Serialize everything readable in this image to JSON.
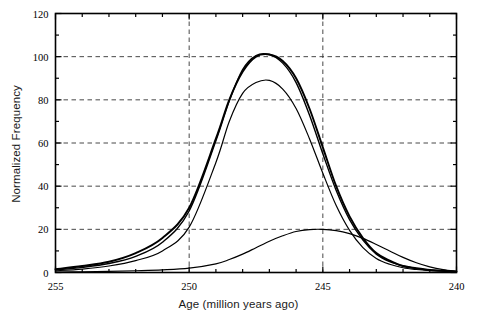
{
  "chart_data": {
    "type": "line",
    "title": "",
    "xlabel": "Age (million years ago)",
    "ylabel": "Normalized Frequency",
    "xlim": [
      255,
      240
    ],
    "ylim": [
      0,
      120
    ],
    "x_reversed": true,
    "grid": true,
    "grid_style": "dashed",
    "legend_position": "none",
    "xticks_major": [
      255,
      250,
      245,
      240
    ],
    "xticks_major_labels": [
      "255",
      "250",
      "245",
      "240"
    ],
    "xtick_minor_interval": 1,
    "yticks_major": [
      0,
      20,
      40,
      60,
      80,
      100,
      120
    ],
    "yticks_major_labels": [
      "0",
      "20",
      "40",
      "60",
      "80",
      "100",
      "120"
    ],
    "ytick_minor_interval": 10,
    "gridlines_x": [
      250,
      245
    ],
    "gridlines_y": [
      20,
      40,
      60,
      80,
      100
    ],
    "x": [
      255,
      254,
      253,
      252,
      251,
      250,
      249,
      248.5,
      248,
      247.5,
      247,
      246.5,
      246,
      245.5,
      245,
      244.5,
      244,
      243.5,
      243,
      242.5,
      242,
      241.5,
      241,
      240.5,
      240
    ],
    "series": [
      {
        "name": "curve-1",
        "peak_x": 247.2,
        "peak_y": 101,
        "values": [
          1.5,
          3,
          5,
          9,
          16,
          30,
          62,
          80,
          93,
          100,
          101,
          98,
          90,
          76,
          58,
          40,
          26,
          16,
          9,
          5.5,
          3,
          2,
          1.2,
          0.8,
          0.5
        ]
      },
      {
        "name": "curve-2",
        "peak_x": 247.3,
        "peak_y": 101,
        "values": [
          1.2,
          2.4,
          4.2,
          7.5,
          14,
          28.5,
          61,
          79.5,
          94,
          100.5,
          101,
          97,
          88,
          73,
          55,
          38,
          24.5,
          15,
          8.5,
          5,
          3,
          1.8,
          1.1,
          0.7,
          0.4
        ]
      },
      {
        "name": "curve-3",
        "peak_x": 247.4,
        "peak_y": 89,
        "values": [
          0.8,
          1.6,
          3,
          5.5,
          10,
          21,
          51,
          70,
          83,
          88,
          89,
          85,
          76,
          62,
          46,
          31,
          19.5,
          11.5,
          6.5,
          3.8,
          2.2,
          1.4,
          0.9,
          0.6,
          0.4
        ]
      },
      {
        "name": "curve-4",
        "peak_x": 245.0,
        "peak_y": 20,
        "values": [
          0.2,
          0.3,
          0.5,
          0.8,
          1.2,
          2,
          4,
          6,
          8.5,
          11.5,
          14.5,
          17,
          19,
          19.9,
          20,
          19.4,
          18,
          15.8,
          13,
          10,
          7,
          4.5,
          2.6,
          1.3,
          0.5
        ]
      }
    ]
  },
  "caption": {
    "partial_text": ""
  }
}
